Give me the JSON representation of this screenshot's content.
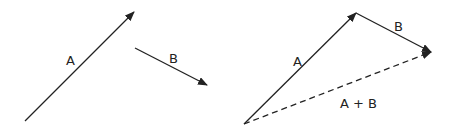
{
  "diagram": {
    "left": {
      "vector_a": {
        "label": "A",
        "from": [
          25,
          121
        ],
        "to": [
          134,
          12
        ]
      },
      "vector_b": {
        "label": "B",
        "from": [
          135,
          48
        ],
        "to": [
          207,
          85
        ]
      }
    },
    "right": {
      "vector_a": {
        "label": "A",
        "from": [
          244,
          124
        ],
        "to": [
          356,
          13
        ]
      },
      "vector_b": {
        "label": "B",
        "from": [
          356,
          13
        ],
        "to": [
          431,
          52
        ]
      },
      "resultant": {
        "label": "A + B",
        "from": [
          244,
          124
        ],
        "to": [
          431,
          52
        ],
        "style": "dashed"
      }
    },
    "stroke_color": "#222222"
  }
}
